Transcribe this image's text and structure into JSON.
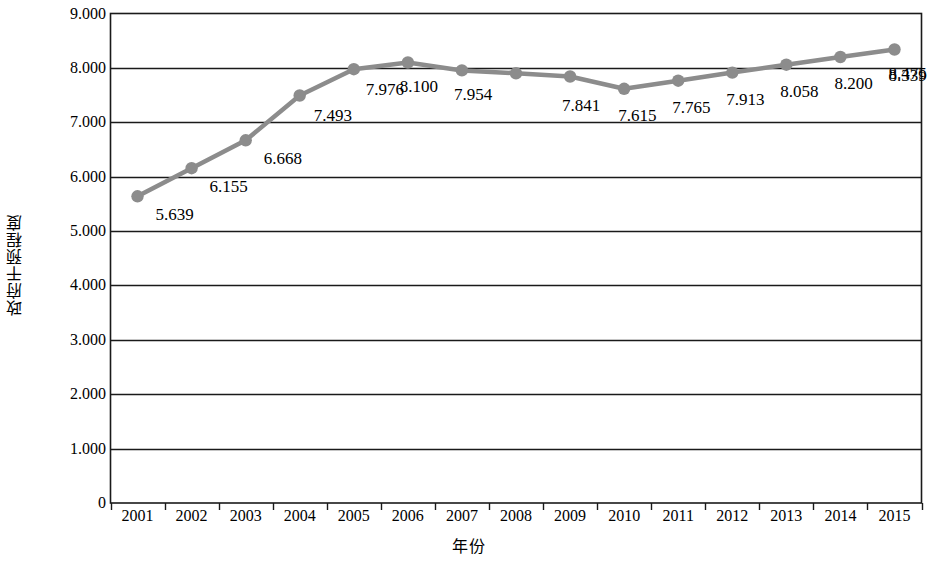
{
  "chart_data": {
    "type": "line",
    "title": "",
    "subtitle": "",
    "xlabel": "年份",
    "ylabel": "政府干预程度",
    "categories": [
      "2001",
      "2002",
      "2003",
      "2004",
      "2005",
      "2006",
      "2007",
      "2008",
      "2009",
      "2010",
      "2011",
      "2012",
      "2013",
      "2014",
      "2015"
    ],
    "values": [
      5.639,
      6.155,
      6.668,
      7.493,
      7.976,
      8.1,
      7.954,
      7.9,
      7.841,
      7.615,
      7.765,
      7.913,
      8.058,
      8.2,
      8.339
    ],
    "point_labels": [
      "5.639",
      "6.155",
      "6.668",
      "7.493",
      "7.976",
      "8.100",
      "7.954",
      "",
      "7.841",
      "7.615",
      "7.765",
      "7.913",
      "8.058",
      "8.200",
      "8.339"
    ],
    "last_point_label": "8.475",
    "ylim": [
      0,
      9
    ],
    "ytick_labels": [
      "9.000",
      "8.000",
      "7.000",
      "6.000",
      "5.000",
      "4.000",
      "3.000",
      "2.000",
      "1.000",
      "0"
    ],
    "ytick_values": [
      9,
      8,
      7,
      6,
      5,
      4,
      3,
      2,
      1,
      0
    ],
    "grid": true,
    "legend": "none",
    "series_color": "#8c8c8c",
    "axis_color": "#1a1a1a",
    "marker": "circle"
  },
  "axes": {
    "y_title": "政府干预程度",
    "x_title": "年份"
  }
}
